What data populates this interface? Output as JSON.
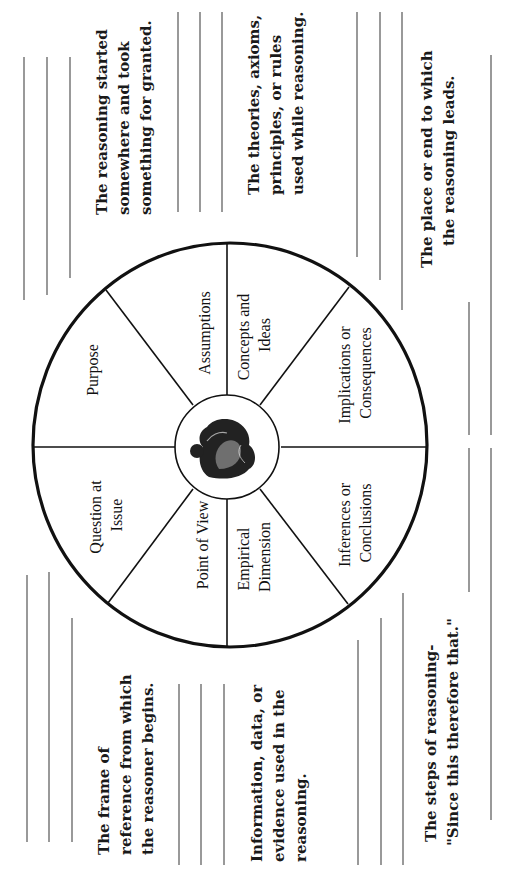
{
  "diagram": {
    "type": "elements-of-reasoning-wheel",
    "orientation": "rotated-90-ccw",
    "center_image": "thinker-statue-icon",
    "elements": [
      {
        "id": "purpose",
        "label_lines": [
          "Purpose"
        ]
      },
      {
        "id": "question",
        "label_lines": [
          "Question at",
          "Issue"
        ]
      },
      {
        "id": "assumptions",
        "label_lines": [
          "Assumptions"
        ],
        "description_lines": [
          "The reasoning started",
          "somewhere and took",
          "something for granted."
        ]
      },
      {
        "id": "concepts",
        "label_lines": [
          "Concepts and",
          "Ideas"
        ],
        "description_lines": [
          "The theories, axioms,",
          "principles, or rules",
          "used while reasoning."
        ]
      },
      {
        "id": "point_of_view",
        "label_lines": [
          "Point of View"
        ],
        "description_lines": [
          "The frame of",
          "reference from which",
          "the reasoner begins."
        ]
      },
      {
        "id": "empirical",
        "label_lines": [
          "Empirical",
          "Dimension"
        ],
        "description_lines": [
          "Information, data, or",
          "evidence used in the",
          "reasoning."
        ]
      },
      {
        "id": "implications",
        "label_lines": [
          "Implications or",
          "Consequences"
        ],
        "description_lines": [
          "The place or end to which",
          "the reasoning leads."
        ]
      },
      {
        "id": "inferences",
        "label_lines": [
          "Inferences  or",
          "Conclusions"
        ],
        "description_lines": [
          "The steps of reasoning-",
          "\"Since this therefore that.\""
        ]
      }
    ]
  },
  "colors": {
    "ink": "#111111",
    "rule": "#555555",
    "background": "#ffffff"
  }
}
